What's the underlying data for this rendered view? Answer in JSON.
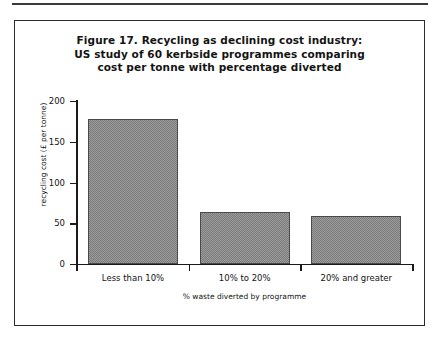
{
  "figure": {
    "title_lines": [
      "Figure 17. Recycling as declining cost industry:",
      "US study of 60 kerbside programmes comparing",
      "cost per tonne with percentage diverted"
    ]
  },
  "chart_data": {
    "type": "bar",
    "title": "Figure 17. Recycling as declining cost industry: US study of 60 kerbside programmes comparing cost per tonne with percentage diverted",
    "categories": [
      "Less than 10%",
      "10% to 20%",
      "20% and greater"
    ],
    "values": [
      178,
      64,
      59
    ],
    "xlabel": "% waste diverted by programme",
    "ylabel": "recycling cost (£ per tonne)",
    "ylim": [
      0,
      200
    ],
    "yticks": [
      0,
      50,
      100,
      150,
      200
    ],
    "ytick_labels": [
      "0",
      "50",
      "100",
      "150",
      "200"
    ],
    "grid": false,
    "legend": false,
    "bar_fill": "#8d8d8d",
    "bar_edge": "#4a4a4a",
    "axis_color": "#1a1a1a"
  }
}
